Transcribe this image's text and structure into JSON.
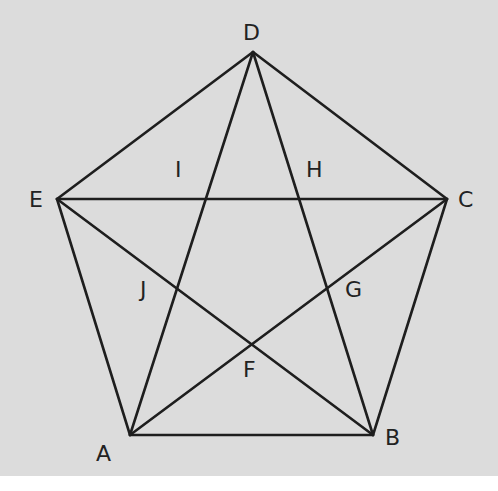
{
  "diagram": {
    "title": "",
    "type": "pentagon with inscribed pentagram",
    "colors": {
      "background": "#dcdcdc",
      "stroke": "#1e1e1e",
      "label": "#222222"
    },
    "points": {
      "A": {
        "x": 130,
        "y": 435,
        "label": "A",
        "lx": 96,
        "ly": 461
      },
      "B": {
        "x": 373,
        "y": 435,
        "label": "B",
        "lx": 385,
        "ly": 445
      },
      "C": {
        "x": 447,
        "y": 199,
        "label": "C",
        "lx": 458,
        "ly": 207
      },
      "D": {
        "x": 253,
        "y": 52,
        "label": "D",
        "lx": 243,
        "ly": 40
      },
      "E": {
        "x": 57,
        "y": 199,
        "label": "E",
        "lx": 29,
        "ly": 207
      },
      "F": {
        "x": 251,
        "y": 345,
        "label": "F",
        "lx": 243,
        "ly": 377
      },
      "G": {
        "x": 327,
        "y": 289,
        "label": "G",
        "lx": 345,
        "ly": 297
      },
      "H": {
        "x": 300,
        "y": 199,
        "label": "H",
        "lx": 306,
        "ly": 177
      },
      "I": {
        "x": 205,
        "y": 199,
        "label": "I",
        "lx": 175,
        "ly": 177
      },
      "J": {
        "x": 177,
        "y": 289,
        "label": "J",
        "lx": 140,
        "ly": 297
      }
    },
    "segments": [
      [
        "A",
        "B"
      ],
      [
        "B",
        "C"
      ],
      [
        "C",
        "D"
      ],
      [
        "D",
        "E"
      ],
      [
        "E",
        "A"
      ],
      [
        "A",
        "D"
      ],
      [
        "A",
        "C"
      ],
      [
        "B",
        "D"
      ],
      [
        "B",
        "E"
      ],
      [
        "E",
        "C"
      ]
    ]
  }
}
